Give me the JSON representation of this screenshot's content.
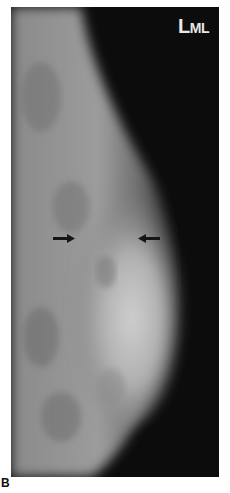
{
  "figure": {
    "panel_letter": "B",
    "view_label": {
      "large": "L",
      "small": "ML"
    },
    "arrows": [
      {
        "name": "left-arrow",
        "direction": "right",
        "x": 52,
        "y": 238
      },
      {
        "name": "right-arrow",
        "direction": "left",
        "x": 130,
        "y": 238
      }
    ],
    "colors": {
      "background": "#0c0c0c",
      "tissue": "#9a9a9a",
      "dense": "#c8c8c8",
      "label": "#e8e8e8"
    }
  }
}
